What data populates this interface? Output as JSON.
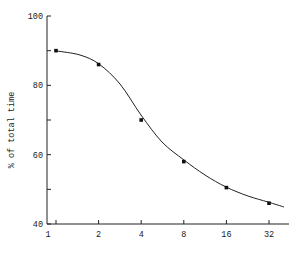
{
  "chart_data": {
    "type": "line",
    "title": "",
    "xlabel": "",
    "ylabel": "% of total time",
    "x_scale": "log2",
    "x": [
      1,
      2,
      4,
      8,
      16,
      32
    ],
    "x_tick_labels": [
      "1",
      "2",
      "4",
      "8",
      "16",
      "32"
    ],
    "y_ticks": [
      40,
      60,
      80,
      100
    ],
    "y_tick_labels": [
      "40",
      "60",
      "80",
      "100"
    ],
    "ylim": [
      40,
      100
    ],
    "grid": false,
    "legend": null,
    "series": [
      {
        "name": "% of total time",
        "values": [
          90,
          86,
          70,
          58,
          50.5,
          46
        ],
        "markers": true,
        "smooth_curve": true
      }
    ]
  }
}
